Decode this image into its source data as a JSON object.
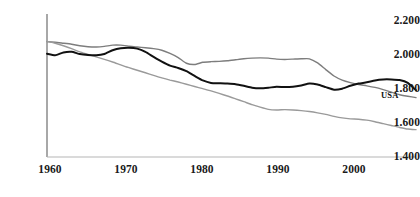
{
  "chart_data": {
    "type": "line",
    "title": "",
    "subtitle": "",
    "xlabel": "",
    "ylabel": "",
    "xlim": [
      1960,
      2005
    ],
    "ylim": [
      1.4,
      2.3
    ],
    "grid": false,
    "legend_position": "inline-annotation",
    "x_tick_labels": [
      "1960",
      "1970",
      "1980",
      "1990",
      "2000"
    ],
    "x_ticks": [
      1960,
      1970,
      1980,
      1990,
      2000
    ],
    "y_tick_labels": [
      "2.200",
      "2.000",
      "1.800",
      "1.600",
      "1.400"
    ],
    "y_ticks": [
      2.2,
      2.0,
      1.8,
      1.6,
      1.4
    ],
    "annotations": [
      {
        "text": "USA",
        "x": 2000,
        "y": 1.79
      }
    ],
    "x": [
      1960,
      1961,
      1962,
      1963,
      1964,
      1965,
      1966,
      1967,
      1968,
      1969,
      1970,
      1971,
      1972,
      1973,
      1974,
      1975,
      1976,
      1977,
      1978,
      1979,
      1980,
      1981,
      1982,
      1983,
      1984,
      1985,
      1986,
      1987,
      1988,
      1989,
      1990,
      1991,
      1992,
      1993,
      1994,
      1995,
      1996,
      1997,
      1998,
      1999,
      2000,
      2001,
      2002,
      2003,
      2004,
      2005
    ],
    "series": [
      {
        "name": "USA",
        "color": "#111111",
        "width": 2.0,
        "values": [
          2.05,
          2.04,
          2.058,
          2.062,
          2.048,
          2.042,
          2.04,
          2.048,
          2.072,
          2.085,
          2.088,
          2.082,
          2.062,
          2.03,
          2.0,
          1.975,
          1.96,
          1.94,
          1.91,
          1.882,
          1.866,
          1.864,
          1.862,
          1.858,
          1.848,
          1.836,
          1.832,
          1.836,
          1.842,
          1.84,
          1.842,
          1.85,
          1.862,
          1.856,
          1.84,
          1.824,
          1.83,
          1.848,
          1.862,
          1.87,
          1.882,
          1.888,
          1.888,
          1.884,
          1.866,
          1.82
        ]
      },
      {
        "name": "upper-gray-series",
        "color": "#7d7d7d",
        "width": 1.4,
        "values": [
          2.126,
          2.122,
          2.116,
          2.11,
          2.1,
          2.094,
          2.092,
          2.096,
          2.104,
          2.104,
          2.098,
          2.092,
          2.088,
          2.082,
          2.072,
          2.052,
          2.026,
          1.99,
          1.982,
          1.996,
          2.0,
          2.002,
          2.006,
          2.012,
          2.018,
          2.022,
          2.024,
          2.022,
          2.016,
          2.014,
          2.016,
          2.018,
          2.018,
          1.992,
          1.95,
          1.91,
          1.884,
          1.868,
          1.856,
          1.848,
          1.838,
          1.824,
          1.808,
          1.792,
          1.782,
          1.774
        ]
      },
      {
        "name": "lower-gray-series",
        "color": "#9a9a9a",
        "width": 1.4,
        "values": [
          2.128,
          2.116,
          2.1,
          2.082,
          2.062,
          2.046,
          2.03,
          2.014,
          1.998,
          1.98,
          1.962,
          1.946,
          1.93,
          1.914,
          1.898,
          1.884,
          1.872,
          1.858,
          1.844,
          1.83,
          1.816,
          1.8,
          1.784,
          1.766,
          1.748,
          1.73,
          1.714,
          1.7,
          1.696,
          1.698,
          1.696,
          1.692,
          1.686,
          1.678,
          1.668,
          1.656,
          1.646,
          1.64,
          1.638,
          1.632,
          1.622,
          1.61,
          1.598,
          1.586,
          1.576,
          1.572
        ]
      }
    ],
    "axis": {
      "line_color": "#8c8c8c",
      "y_axis_color": "#6e6e6e"
    }
  }
}
